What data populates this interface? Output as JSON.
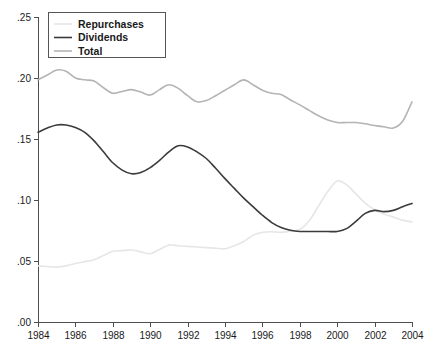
{
  "chart_data": {
    "type": "line",
    "title": "",
    "subtitle": "",
    "xlabel": "",
    "ylabel": "",
    "xlim": [
      1984,
      2004
    ],
    "ylim": [
      0.0,
      0.25
    ],
    "grid": false,
    "legend_position": "top-left",
    "x_ticks": [
      1984,
      1986,
      1988,
      1990,
      1992,
      1994,
      1996,
      1998,
      2000,
      2002,
      2004
    ],
    "x_tick_labels": [
      "1984",
      "1986",
      "1988",
      "1990",
      "1992",
      "1994",
      "1996",
      "1998",
      "2000",
      "2002",
      "2004"
    ],
    "y_ticks": [
      0.0,
      0.05,
      0.1,
      0.15,
      0.2,
      0.25
    ],
    "y_tick_labels": [
      ".00",
      ".05",
      ".10",
      ".15",
      ".20",
      ".25"
    ],
    "x": [
      1984,
      1984.5,
      1985,
      1985.5,
      1986,
      1986.5,
      1987,
      1987.5,
      1988,
      1988.5,
      1989,
      1989.5,
      1990,
      1990.5,
      1991,
      1991.5,
      1992,
      1992.5,
      1993,
      1993.5,
      1994,
      1994.5,
      1995,
      1995.5,
      1996,
      1996.5,
      1997,
      1997.5,
      1998,
      1998.5,
      1999,
      1999.5,
      2000,
      2000.5,
      2001,
      2001.5,
      2002,
      2002.5,
      2003,
      2003.5,
      2004
    ],
    "series": [
      {
        "name": "Repurchases",
        "color": "#e6e6e6",
        "width": 1.6,
        "values": [
          0.046,
          0.0455,
          0.045,
          0.046,
          0.048,
          0.0495,
          0.051,
          0.0545,
          0.058,
          0.0585,
          0.059,
          0.0575,
          0.056,
          0.0595,
          0.063,
          0.0625,
          0.062,
          0.0615,
          0.061,
          0.0605,
          0.06,
          0.0625,
          0.066,
          0.071,
          0.0735,
          0.074,
          0.0735,
          0.0745,
          0.076,
          0.083,
          0.095,
          0.107,
          0.1155,
          0.1125,
          0.105,
          0.0975,
          0.092,
          0.0885,
          0.086,
          0.0835,
          0.082
        ]
      },
      {
        "name": "Dividends",
        "color": "#3b3b3b",
        "width": 1.6,
        "values": [
          0.1555,
          0.159,
          0.1615,
          0.1615,
          0.1595,
          0.1555,
          0.1485,
          0.1395,
          0.1305,
          0.1245,
          0.1215,
          0.1225,
          0.1265,
          0.1325,
          0.1395,
          0.1445,
          0.1435,
          0.1395,
          0.134,
          0.126,
          0.1175,
          0.1095,
          0.1015,
          0.0945,
          0.0875,
          0.0815,
          0.0775,
          0.0752,
          0.0742,
          0.0742,
          0.0742,
          0.0742,
          0.0742,
          0.0765,
          0.0825,
          0.089,
          0.0915,
          0.0905,
          0.0915,
          0.0945,
          0.0972
        ]
      },
      {
        "name": "Total",
        "color": "#b4b4b4",
        "width": 1.6,
        "values": [
          0.1985,
          0.2025,
          0.2065,
          0.2055,
          0.2,
          0.1985,
          0.1975,
          0.192,
          0.1875,
          0.189,
          0.1905,
          0.1885,
          0.186,
          0.1905,
          0.1945,
          0.1915,
          0.1855,
          0.1805,
          0.1815,
          0.1855,
          0.19,
          0.1945,
          0.1985,
          0.1945,
          0.19,
          0.1875,
          0.1865,
          0.182,
          0.178,
          0.1735,
          0.169,
          0.1655,
          0.1635,
          0.1635,
          0.1635,
          0.1625,
          0.161,
          0.16,
          0.159,
          0.1645,
          0.1805
        ]
      }
    ]
  },
  "legend": {
    "entries": [
      {
        "label": "Repurchases",
        "color": "#e6e6e6"
      },
      {
        "label": "Dividends",
        "color": "#3b3b3b"
      },
      {
        "label": "Total",
        "color": "#b4b4b4"
      }
    ]
  }
}
